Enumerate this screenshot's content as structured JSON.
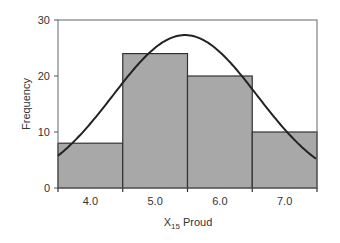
{
  "chart_data": {
    "type": "bar",
    "subtype": "histogram_with_normal_curve",
    "title": "",
    "xlabel": "X15 Proud",
    "xlabel_main": "X",
    "xlabel_subscript": "15",
    "xlabel_rest": " Proud",
    "ylabel": "Frequency",
    "categories": [
      "4.0",
      "5.0",
      "6.0",
      "7.0"
    ],
    "values": [
      8,
      24,
      20,
      10
    ],
    "ylim": [
      0,
      30
    ],
    "yticks": [
      "0",
      "10",
      "20",
      "30"
    ],
    "grid": false,
    "legend": null,
    "overlay": {
      "type": "normal_curve",
      "description": "Fitted normal distribution curve, peak approx 27.3 near x=5.5",
      "peak": 27.3
    },
    "colors": {
      "bar_fill": "#a8a8a8",
      "bar_stroke": "#333333",
      "curve": "#222222",
      "axis": "#555555"
    }
  }
}
